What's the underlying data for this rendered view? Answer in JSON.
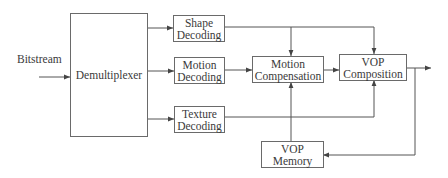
{
  "diagram": {
    "input_label": "Bitstream",
    "blocks": {
      "demux": {
        "label": "Demultiplexer"
      },
      "shape": {
        "line1": "Shape",
        "line2": "Decoding"
      },
      "motion_dec": {
        "line1": "Motion",
        "line2": "Decoding"
      },
      "texture": {
        "line1": "Texture",
        "line2": "Decoding"
      },
      "motion_comp": {
        "line1": "Motion",
        "line2": "Compensation"
      },
      "vop_comp": {
        "line1": "VOP",
        "line2": "Composition"
      },
      "vop_mem": {
        "line1": "VOP",
        "line2": "Memory"
      }
    },
    "connections": [
      {
        "from": "Bitstream",
        "to": "Demultiplexer"
      },
      {
        "from": "Demultiplexer",
        "to": "Shape Decoding"
      },
      {
        "from": "Demultiplexer",
        "to": "Motion Decoding"
      },
      {
        "from": "Demultiplexer",
        "to": "Texture Decoding"
      },
      {
        "from": "Shape Decoding",
        "to": "Motion Compensation"
      },
      {
        "from": "Shape Decoding",
        "to": "VOP Composition"
      },
      {
        "from": "Motion Decoding",
        "to": "Motion Compensation"
      },
      {
        "from": "Motion Compensation",
        "to": "VOP Composition"
      },
      {
        "from": "Texture Decoding",
        "to": "VOP Composition"
      },
      {
        "from": "VOP Memory",
        "to": "Motion Compensation"
      },
      {
        "from": "VOP Composition",
        "to": "Output"
      },
      {
        "from": "VOP Composition",
        "to": "VOP Memory"
      }
    ],
    "colors": {
      "line": "#555555",
      "border": "#6a6a6a",
      "text": "#3a3a3a"
    }
  }
}
